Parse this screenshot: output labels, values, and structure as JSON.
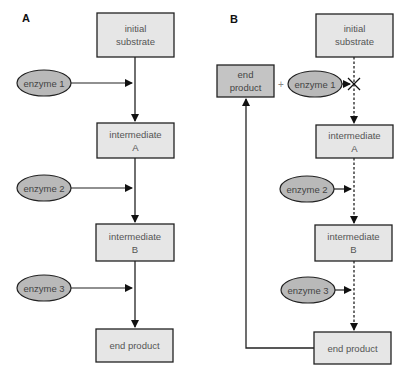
{
  "colors": {
    "box_fill": "#e6e6e6",
    "end_product_feedback_fill": "#c4c4c4",
    "enzyme_fill": "#b9b9b9",
    "stroke": "#222222"
  },
  "panel_a": {
    "label": "A",
    "nodes": {
      "initial_substrate": [
        "initial",
        "substrate"
      ],
      "intermediate_a": [
        "intermediate",
        "A"
      ],
      "intermediate_b": [
        "intermediate",
        "B"
      ],
      "end_product": "end product"
    },
    "enzymes": [
      "enzyme 1",
      "enzyme 2",
      "enzyme 3"
    ],
    "arrow_style": "solid"
  },
  "panel_b": {
    "label": "B",
    "nodes": {
      "initial_substrate": [
        "initial",
        "substrate"
      ],
      "intermediate_a": [
        "intermediate",
        "A"
      ],
      "intermediate_b": [
        "intermediate",
        "B"
      ],
      "end_product": "end product",
      "end_product_inhibitor": [
        "end",
        "product"
      ]
    },
    "plus_sign": "+",
    "enzymes": [
      "enzyme 1",
      "enzyme 2",
      "enzyme 3"
    ],
    "arrow_style": "dashed",
    "inhibition_mark": "✕"
  }
}
